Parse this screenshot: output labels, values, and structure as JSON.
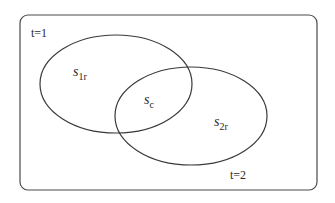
{
  "diagram": {
    "type": "venn",
    "frame": {
      "label_top": "t=1",
      "label_bottom": "t=2"
    },
    "sets": [
      {
        "id": "s1r",
        "base": "s",
        "subscript": "1r"
      },
      {
        "id": "s2r",
        "base": "s",
        "subscript": "2r"
      }
    ],
    "intersection": {
      "base": "s",
      "subscript": "c"
    },
    "colors": {
      "stroke": "#3a3a3a",
      "frame_stroke": "#4a4a4a",
      "text": "#2a2a2a",
      "background": "#ffffff"
    }
  }
}
